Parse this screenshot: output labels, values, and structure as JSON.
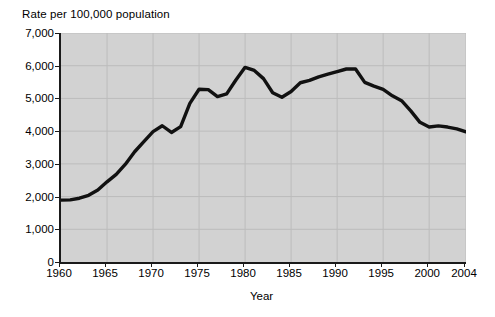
{
  "chart_data": {
    "type": "line",
    "title": "",
    "ylabel": "Rate per 100,000 population",
    "xlabel": "Year",
    "ylim": [
      0,
      7000
    ],
    "xlim": [
      1960,
      2004
    ],
    "grid": true,
    "legend": "none",
    "y_ticks": [
      {
        "value": 7000,
        "label": "7,000"
      },
      {
        "value": 6000,
        "label": "6,000"
      },
      {
        "value": 5000,
        "label": "5,000"
      },
      {
        "value": 4000,
        "label": "4,000"
      },
      {
        "value": 3000,
        "label": "3,000"
      },
      {
        "value": 2000,
        "label": "2,000"
      },
      {
        "value": 1000,
        "label": "1,000"
      },
      {
        "value": 0,
        "label": "0"
      }
    ],
    "x_ticks": [
      {
        "value": 1960,
        "label": "1960"
      },
      {
        "value": 1965,
        "label": "1965"
      },
      {
        "value": 1970,
        "label": "1970"
      },
      {
        "value": 1975,
        "label": "1975"
      },
      {
        "value": 1980,
        "label": "1980"
      },
      {
        "value": 1985,
        "label": "1985"
      },
      {
        "value": 1990,
        "label": "1990"
      },
      {
        "value": 1995,
        "label": "1995"
      },
      {
        "value": 2000,
        "label": "2000"
      },
      {
        "value": 2004,
        "label": "2004"
      }
    ],
    "series": [
      {
        "name": "Rate per 100,000 population",
        "color": "#111111",
        "line_width": 3.4,
        "x": [
          1960,
          1961,
          1962,
          1963,
          1964,
          1965,
          1966,
          1967,
          1968,
          1969,
          1970,
          1971,
          1972,
          1973,
          1974,
          1975,
          1976,
          1977,
          1978,
          1979,
          1980,
          1981,
          1982,
          1983,
          1984,
          1985,
          1986,
          1987,
          1988,
          1989,
          1990,
          1991,
          1992,
          1993,
          1994,
          1995,
          1996,
          1997,
          1998,
          1999,
          2000,
          2001,
          2002,
          2003,
          2004
        ],
        "values": [
          1890,
          1900,
          1950,
          2040,
          2200,
          2450,
          2680,
          2990,
          3370,
          3680,
          3985,
          4165,
          3960,
          4140,
          4850,
          5280,
          5270,
          5055,
          5140,
          5565,
          5950,
          5855,
          5605,
          5175,
          5035,
          5210,
          5480,
          5550,
          5660,
          5740,
          5820,
          5900,
          5900,
          5490,
          5375,
          5275,
          5080,
          4930,
          4620,
          4270,
          4125,
          4160,
          4125,
          4070,
          3980
        ]
      }
    ],
    "annotations": {
      "peak_1980": 5950,
      "peak_1991": 5900,
      "start_1960": 1890,
      "end_2004": 3980
    }
  },
  "axis": {
    "y_caption": "Rate per 100,000 population",
    "x_caption": "Year"
  },
  "style": {
    "plot_background": "#d2d2d2",
    "line_color": "#111111",
    "axis_color": "#1a1a1a",
    "grid_color": "#bcbcbc",
    "text_color": "#000000"
  }
}
